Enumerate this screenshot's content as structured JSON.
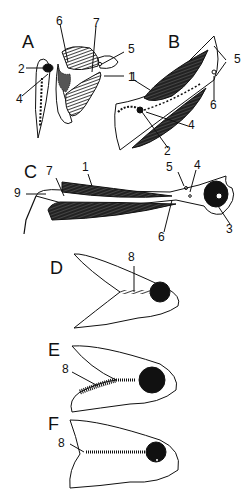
{
  "panels": {
    "A": {
      "label": "A",
      "numbers": [
        "6",
        "7",
        "5",
        "2",
        "1",
        "4"
      ]
    },
    "B": {
      "label": "B",
      "numbers": [
        "5",
        "1",
        "6",
        "4",
        "2"
      ]
    },
    "C": {
      "label": "C",
      "numbers": [
        "7",
        "1",
        "5",
        "4",
        "9",
        "3",
        "6"
      ]
    },
    "D": {
      "label": "D",
      "numbers": [
        "8"
      ]
    },
    "E": {
      "label": "E",
      "numbers": [
        "8"
      ]
    },
    "F": {
      "label": "F",
      "numbers": [
        "8"
      ]
    }
  }
}
